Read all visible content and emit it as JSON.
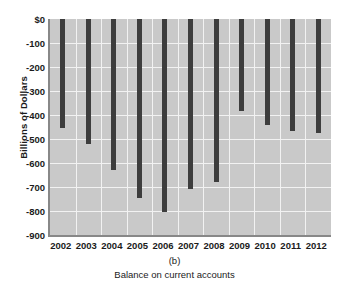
{
  "chart_data": {
    "type": "bar",
    "title": "",
    "panel_letter": "(b)",
    "caption": "Balance on current accounts",
    "xlabel": "",
    "ylabel": "Billions of Dollars",
    "categories": [
      "2002",
      "2003",
      "2004",
      "2005",
      "2006",
      "2007",
      "2008",
      "2009",
      "2010",
      "2011",
      "2012"
    ],
    "values": [
      -455,
      -520,
      -630,
      -745,
      -805,
      -710,
      -680,
      -385,
      -440,
      -465,
      -475
    ],
    "ylim": [
      -900,
      0
    ],
    "ytick_values": [
      0,
      -100,
      -200,
      -300,
      -400,
      -500,
      -600,
      -700,
      -800,
      -900
    ],
    "ytick_labels": [
      "$0",
      "-100",
      "-200",
      "-300",
      "-400",
      "-500",
      "-600",
      "-700",
      "-800",
      "-900"
    ],
    "grid": true,
    "legend": "none",
    "bar_color": "#3d3d3d",
    "plot_background": "#c9c9c9",
    "gridline_color": "#f2f2f2"
  }
}
